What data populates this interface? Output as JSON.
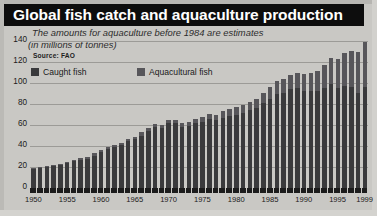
{
  "header": {
    "title": "Global fish catch and aquaculture production"
  },
  "notes": {
    "line1": "The amounts for aquaculture before 1984 are estimates",
    "line2": "(in millions of tonnes)",
    "source": "Source: FAO"
  },
  "legend": {
    "items": [
      {
        "label": "Caught fish",
        "color": "#3a3a3c"
      },
      {
        "label": "Aquacultural fish",
        "color": "#57565a"
      }
    ]
  },
  "colors": {
    "title_bar": "#0d0d0d",
    "background": "#c9c8c4",
    "caught": "#3a3a3c",
    "aquaculture": "#57565a",
    "gridline": "#9c9b97"
  },
  "chart_data": {
    "type": "bar",
    "stacked": true,
    "title": "Global fish catch and aquaculture production",
    "subtitle": "The amounts for aquaculture before 1984 are estimates",
    "xlabel": "",
    "ylabel": "in millions of tonnes",
    "ylim": [
      0,
      145
    ],
    "yticks": [
      0,
      20,
      40,
      60,
      80,
      100,
      120,
      140
    ],
    "ytick_labels": [
      "0",
      "20",
      "40",
      "60",
      "80",
      "100",
      "120",
      "140"
    ],
    "grid": true,
    "legend_position": "top-left",
    "x": [
      1950,
      1951,
      1952,
      1953,
      1954,
      1955,
      1956,
      1957,
      1958,
      1959,
      1960,
      1961,
      1962,
      1963,
      1964,
      1965,
      1966,
      1967,
      1968,
      1969,
      1970,
      1971,
      1972,
      1973,
      1974,
      1975,
      1976,
      1977,
      1978,
      1979,
      1980,
      1981,
      1982,
      1983,
      1984,
      1985,
      1986,
      1987,
      1988,
      1989,
      1990,
      1991,
      1992,
      1993,
      1994,
      1995,
      1996,
      1997,
      1998,
      1999
    ],
    "xtick_labels": [
      "1950",
      "1955",
      "1960",
      "1965",
      "1970",
      "1975",
      "1980",
      "1985",
      "1990",
      "1995",
      "1999"
    ],
    "series": [
      {
        "name": "Caught fish",
        "color": "#3a3a3c",
        "values": [
          18,
          19,
          20,
          21,
          22,
          24,
          26,
          27,
          28,
          31,
          34,
          37,
          39,
          41,
          45,
          47,
          50,
          54,
          58,
          57,
          62,
          62,
          58,
          59,
          62,
          63,
          66,
          65,
          67,
          69,
          70,
          72,
          74,
          76,
          81,
          85,
          90,
          91,
          94,
          95,
          93,
          93,
          93,
          95,
          99,
          95,
          97,
          96,
          91,
          96
        ]
      },
      {
        "name": "Aquacultural fish",
        "color": "#57565a",
        "values": [
          1,
          1,
          1,
          1,
          1,
          1,
          1,
          2,
          2,
          2,
          2,
          2,
          2,
          2,
          2,
          2,
          3,
          3,
          3,
          3,
          3,
          3,
          4,
          4,
          4,
          5,
          5,
          5,
          6,
          6,
          7,
          7,
          8,
          9,
          10,
          11,
          12,
          13,
          14,
          15,
          16,
          17,
          19,
          22,
          25,
          28,
          32,
          35,
          39,
          43
        ]
      }
    ],
    "totals": [
      19,
      20,
      21,
      22,
      23,
      25,
      27,
      29,
      30,
      33,
      36,
      39,
      41,
      43,
      47,
      49,
      53,
      57,
      61,
      60,
      65,
      65,
      62,
      63,
      66,
      68,
      71,
      70,
      73,
      75,
      77,
      79,
      82,
      85,
      91,
      96,
      102,
      104,
      108,
      110,
      109,
      110,
      112,
      117,
      124,
      123,
      129,
      131,
      130,
      139
    ]
  }
}
